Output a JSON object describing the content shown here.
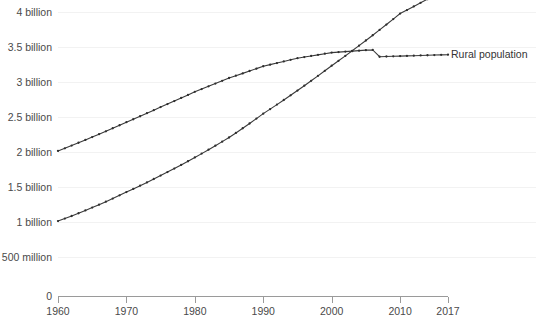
{
  "chart_data": {
    "type": "line",
    "title": "",
    "subtitle": "",
    "xlabel": "",
    "ylabel": "",
    "xlim": [
      1960,
      2017
    ],
    "ylim": [
      0,
      4200000000
    ],
    "grid": true,
    "legend_position": "right-inline",
    "x": [
      1960,
      1961,
      1962,
      1963,
      1964,
      1965,
      1966,
      1967,
      1968,
      1969,
      1970,
      1971,
      1972,
      1973,
      1974,
      1975,
      1976,
      1977,
      1978,
      1979,
      1980,
      1981,
      1982,
      1983,
      1984,
      1985,
      1986,
      1987,
      1988,
      1989,
      1990,
      1991,
      1992,
      1993,
      1994,
      1995,
      1996,
      1997,
      1998,
      1999,
      2000,
      2001,
      2002,
      2003,
      2004,
      2005,
      2006,
      2007,
      2008,
      2009,
      2010,
      2011,
      2012,
      2013,
      2014,
      2015,
      2016,
      2017
    ],
    "x_tick_labels": [
      "1960",
      "1970",
      "1980",
      "1990",
      "2000",
      "2010",
      "2017"
    ],
    "x_tick_values": [
      1960,
      1970,
      1980,
      1990,
      2000,
      2010,
      2017
    ],
    "y_tick_labels": [
      "500 million",
      "1 billion",
      "1.5 billion",
      "2 billion",
      "2.5 billion",
      "3 billion",
      "3.5 billion",
      "4 billion"
    ],
    "y_tick_values": [
      500000000,
      1000000000,
      1500000000,
      2000000000,
      2500000000,
      3000000000,
      3500000000,
      4000000000
    ],
    "y_zero_label": "0",
    "series": [
      {
        "name": "Urban population",
        "label": "Urban population",
        "color": "#3a3a3a",
        "values": [
          1.013,
          1.049,
          1.086,
          1.125,
          1.165,
          1.206,
          1.248,
          1.291,
          1.335,
          1.381,
          1.428,
          1.473,
          1.519,
          1.566,
          1.614,
          1.663,
          1.713,
          1.763,
          1.815,
          1.868,
          1.922,
          1.977,
          2.033,
          2.09,
          2.148,
          2.207,
          2.272,
          2.339,
          2.407,
          2.477,
          2.548,
          2.612,
          2.677,
          2.743,
          2.81,
          2.878,
          2.947,
          3.017,
          3.088,
          3.16,
          3.233,
          3.303,
          3.374,
          3.446,
          3.519,
          3.593,
          3.668,
          3.744,
          3.821,
          3.899,
          3.978,
          4.028,
          4.079,
          4.131,
          4.184,
          4.238,
          4.293,
          4.35
        ]
      },
      {
        "name": "Rural population",
        "label": "Rural population",
        "color": "#3a3a3a",
        "values": [
          2.015,
          2.053,
          2.092,
          2.132,
          2.172,
          2.213,
          2.254,
          2.296,
          2.339,
          2.382,
          2.426,
          2.468,
          2.511,
          2.554,
          2.598,
          2.642,
          2.685,
          2.728,
          2.772,
          2.816,
          2.86,
          2.899,
          2.938,
          2.977,
          3.017,
          3.057,
          3.09,
          3.123,
          3.157,
          3.191,
          3.225,
          3.248,
          3.271,
          3.294,
          3.317,
          3.34,
          3.356,
          3.372,
          3.388,
          3.404,
          3.42,
          3.427,
          3.434,
          3.441,
          3.448,
          3.455,
          3.458,
          3.361,
          3.364,
          3.367,
          3.37,
          3.373,
          3.376,
          3.379,
          3.382,
          3.385,
          3.388,
          3.39
        ]
      }
    ],
    "value_units": "billions",
    "crossover": {
      "year": 2007,
      "value": 3.37
    }
  },
  "legend": {
    "urban_label": "Urban population",
    "rural_label": "Rural population"
  }
}
